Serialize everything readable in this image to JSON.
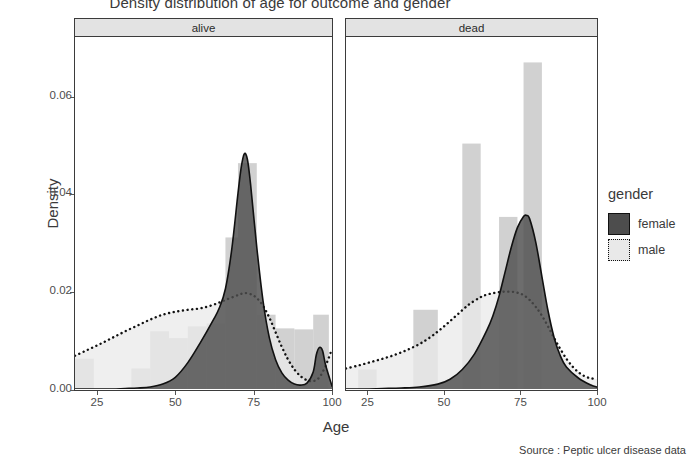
{
  "title": "Density distribution of age for outcome and gender",
  "caption": "Source : Peptic ulcer disease data",
  "axes": {
    "ylabel": "Density",
    "xlabel": "Age",
    "yticks": [
      "0.00",
      "0.02",
      "0.04",
      "0.06"
    ],
    "xticks": [
      "25",
      "50",
      "75",
      "100"
    ]
  },
  "legend": {
    "title": "gender",
    "items": [
      {
        "label": "female",
        "color": "#4d4d4d",
        "border": "solid"
      },
      {
        "label": "male",
        "color": "#e9e9e9",
        "border": "dotted"
      }
    ]
  },
  "panels": [
    {
      "id": "alive",
      "label": "alive"
    },
    {
      "id": "dead",
      "label": "dead"
    }
  ],
  "chart_data": {
    "type": "area",
    "title": "Density distribution of age for outcome and gender",
    "xlabel": "Age",
    "ylabel": "Density",
    "xlim": [
      18,
      100
    ],
    "ylim": [
      0,
      0.072
    ],
    "xticks": [
      25,
      50,
      75,
      100
    ],
    "yticks": [
      0.0,
      0.02,
      0.04,
      0.06
    ],
    "grid": false,
    "legend_position": "right",
    "legend_title": "gender",
    "facets": [
      "alive",
      "dead"
    ],
    "facet_variable": "outcome",
    "series": [
      {
        "facet": "alive",
        "name": "female",
        "fill": "#4d4d4d",
        "line": "solid",
        "x": [
          18,
          22,
          26,
          30,
          34,
          38,
          42,
          46,
          50,
          54,
          58,
          62,
          64,
          66,
          68,
          70,
          71,
          72,
          73,
          74,
          76,
          78,
          80,
          82,
          84,
          86,
          88,
          90,
          92,
          94,
          95,
          96,
          97,
          98,
          100
        ],
        "y": [
          0.0,
          0.0,
          0.0,
          0.0,
          0.0001,
          0.0002,
          0.0004,
          0.001,
          0.0024,
          0.0054,
          0.0095,
          0.014,
          0.0165,
          0.0205,
          0.0285,
          0.04,
          0.0452,
          0.0481,
          0.047,
          0.042,
          0.029,
          0.018,
          0.0105,
          0.006,
          0.0033,
          0.0018,
          0.001,
          0.0008,
          0.0012,
          0.0035,
          0.007,
          0.0085,
          0.0078,
          0.0048,
          0.0006
        ]
      },
      {
        "facet": "alive",
        "name": "male",
        "fill": "#e9e9e9",
        "line": "dotted",
        "x": [
          18,
          22,
          26,
          30,
          34,
          38,
          42,
          46,
          50,
          54,
          58,
          62,
          66,
          70,
          72,
          74,
          76,
          78,
          80,
          82,
          84,
          86,
          88,
          90,
          92,
          94,
          96,
          98,
          100
        ],
        "y": [
          0.0068,
          0.008,
          0.0092,
          0.0105,
          0.0118,
          0.013,
          0.0142,
          0.0152,
          0.0158,
          0.0162,
          0.0165,
          0.0172,
          0.0182,
          0.0192,
          0.0196,
          0.0194,
          0.0186,
          0.017,
          0.0146,
          0.0116,
          0.0086,
          0.006,
          0.004,
          0.0026,
          0.0018,
          0.0016,
          0.0024,
          0.0048,
          0.0082
        ]
      },
      {
        "facet": "dead",
        "name": "female",
        "fill": "#4d4d4d",
        "line": "solid",
        "x": [
          18,
          24,
          30,
          36,
          42,
          48,
          52,
          56,
          60,
          64,
          66,
          68,
          70,
          72,
          74,
          76,
          77,
          78,
          80,
          82,
          84,
          86,
          88,
          90,
          94,
          98,
          100
        ],
        "y": [
          0.0,
          0.0,
          0.0001,
          0.0002,
          0.0004,
          0.001,
          0.002,
          0.004,
          0.0072,
          0.012,
          0.015,
          0.019,
          0.024,
          0.029,
          0.033,
          0.0353,
          0.0355,
          0.0348,
          0.03,
          0.023,
          0.016,
          0.0105,
          0.0068,
          0.0045,
          0.0022,
          0.0008,
          0.0004
        ]
      },
      {
        "facet": "dead",
        "name": "male",
        "fill": "#e9e9e9",
        "line": "dotted",
        "x": [
          18,
          22,
          26,
          30,
          34,
          38,
          42,
          46,
          50,
          54,
          58,
          62,
          64,
          66,
          68,
          70,
          72,
          74,
          76,
          78,
          80,
          82,
          84,
          86,
          88,
          90,
          92,
          94,
          96,
          98,
          100
        ],
        "y": [
          0.0042,
          0.0048,
          0.0055,
          0.0062,
          0.007,
          0.008,
          0.0092,
          0.0108,
          0.0128,
          0.015,
          0.0172,
          0.0188,
          0.0193,
          0.0196,
          0.0198,
          0.0199,
          0.0199,
          0.0197,
          0.0192,
          0.0182,
          0.0168,
          0.015,
          0.0128,
          0.0104,
          0.0082,
          0.0062,
          0.0046,
          0.0034,
          0.0026,
          0.0022,
          0.002
        ]
      }
    ],
    "histograms": [
      {
        "facet": "alive",
        "color": "#c9c9c9",
        "bars": [
          {
            "x0": 18,
            "x1": 24,
            "height": 0.0062
          },
          {
            "x0": 24,
            "x1": 30,
            "height": 0.0
          },
          {
            "x0": 30,
            "x1": 36,
            "height": 0.0
          },
          {
            "x0": 36,
            "x1": 42,
            "height": 0.0042
          },
          {
            "x0": 42,
            "x1": 48,
            "height": 0.0118
          },
          {
            "x0": 48,
            "x1": 54,
            "height": 0.0104
          },
          {
            "x0": 54,
            "x1": 60,
            "height": 0.0128
          },
          {
            "x0": 60,
            "x1": 66,
            "height": 0.0134
          },
          {
            "x0": 66,
            "x1": 70,
            "height": 0.031
          },
          {
            "x0": 70,
            "x1": 76,
            "height": 0.0462
          },
          {
            "x0": 76,
            "x1": 82,
            "height": 0.0152
          },
          {
            "x0": 82,
            "x1": 88,
            "height": 0.0124
          },
          {
            "x0": 88,
            "x1": 94,
            "height": 0.0122
          },
          {
            "x0": 94,
            "x1": 99,
            "height": 0.0152
          }
        ]
      },
      {
        "facet": "dead",
        "color": "#c9c9c9",
        "bars": [
          {
            "x0": 22,
            "x1": 28,
            "height": 0.004
          },
          {
            "x0": 40,
            "x1": 48,
            "height": 0.0162
          },
          {
            "x0": 56,
            "x1": 62,
            "height": 0.0502
          },
          {
            "x0": 68,
            "x1": 74,
            "height": 0.0352
          },
          {
            "x0": 76,
            "x1": 82,
            "height": 0.0668
          }
        ]
      }
    ]
  }
}
